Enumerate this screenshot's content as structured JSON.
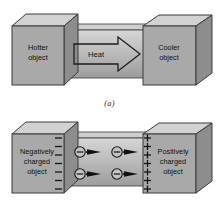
{
  "figure": {
    "background_color": "#ffffff",
    "block_face_color": "#a9a9a9",
    "block_top_color": "#d2d2d2",
    "block_side_color": "#8d8d8d",
    "bar_color": "#c2c2c2",
    "outline_color": "#3a3a3a",
    "text_color": "#101010"
  },
  "panel_a": {
    "caption": "(a)",
    "left_block": {
      "line1": "Hotter",
      "line2": "object"
    },
    "right_block": {
      "line1": "Cooler",
      "line2": "object"
    },
    "flow_arrow": {
      "label": "Heat",
      "direction": "right",
      "style": "hollow-outline"
    }
  },
  "panel_b": {
    "caption": "(b)",
    "left_block": {
      "line1": "Negatively",
      "line2": "charged",
      "line3": "object"
    },
    "right_block": {
      "line1": "Positively",
      "line2": "charged",
      "line3": "object"
    },
    "left_charge_symbol": "−",
    "left_charge_count": 7,
    "right_charge_symbol": "+",
    "right_charge_count": 7,
    "carriers": [
      {
        "symbol": "−",
        "label": "electron",
        "row": 1,
        "col": 1
      },
      {
        "symbol": "−",
        "label": "electron",
        "row": 1,
        "col": 2
      },
      {
        "symbol": "−",
        "label": "electron",
        "row": 2,
        "col": 1
      },
      {
        "symbol": "−",
        "label": "electron",
        "row": 2,
        "col": 2
      }
    ],
    "carrier_arrow_direction": "right",
    "carrier_arrow_style": "solid-filled"
  }
}
